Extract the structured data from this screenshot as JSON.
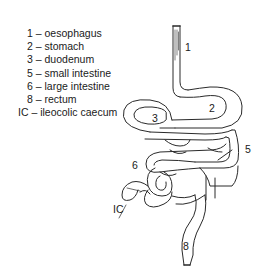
{
  "legend": [
    {
      "key": "1",
      "sep": " – ",
      "label": "oesophagus"
    },
    {
      "key": "2",
      "sep": " – ",
      "label": "stomach"
    },
    {
      "key": "3",
      "sep": " – ",
      "label": "duodenum"
    },
    {
      "key": "5",
      "sep": " – ",
      "label": "small intestine"
    },
    {
      "key": "6",
      "sep": " – ",
      "label": "large intestine"
    },
    {
      "key": "8",
      "sep": " – ",
      "label": "rectum"
    },
    {
      "key": "IC",
      "sep": " – ",
      "label": "ileocolic caecum"
    }
  ],
  "diagram_labels": {
    "oesophagus": "1",
    "stomach": "2",
    "duodenum": "3",
    "small_intestine": "5",
    "large_intestine": "6",
    "caecum": "IC",
    "rectum": "8"
  },
  "colors": {
    "stroke": "#2a2a2a",
    "background": "#ffffff",
    "text": "#1a1a1a"
  }
}
